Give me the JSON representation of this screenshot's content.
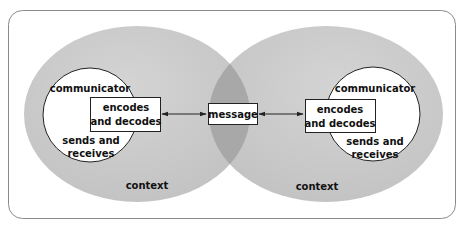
{
  "diagram": {
    "title": "",
    "left": {
      "role": "communicator",
      "box": [
        "encodes",
        "and decodes"
      ],
      "circle_lower": [
        "sends and",
        "receives"
      ],
      "context": "context"
    },
    "right": {
      "role": "communicator",
      "box": [
        "encodes",
        "and decodes"
      ],
      "circle_lower": [
        "sends and",
        "receives"
      ],
      "context": "context"
    },
    "center": {
      "label": "message"
    },
    "colors": {
      "context_fill": "#c9c9c9",
      "overlap_fill": "#a6a6a6",
      "circle_fill": "#ffffff",
      "stroke": "#333333",
      "frame": "#8a8a8a"
    }
  }
}
